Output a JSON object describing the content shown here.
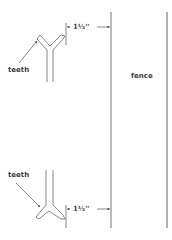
{
  "diagram": {
    "labels": {
      "teeth_top": "teeth",
      "teeth_bottom": "teeth",
      "fence": "fence",
      "dimension_top": "1½''",
      "dimension_bottom": "1½''"
    },
    "colors": {
      "line": "#555555",
      "text": "#3a3a3a",
      "background": "#ffffff"
    }
  }
}
